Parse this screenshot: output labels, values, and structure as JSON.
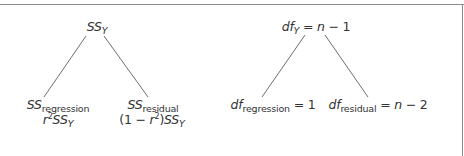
{
  "diagram": {
    "ss_tree": {
      "root": {
        "main": "SS",
        "sub": "Y"
      },
      "left": {
        "main": "SS",
        "sub": "regression",
        "formula": {
          "base": "r",
          "exp": "2",
          "main": "SS",
          "sub": "Y"
        }
      },
      "right": {
        "main": "SS",
        "sub": "residual",
        "formula": {
          "prefix": "(1 − ",
          "base": "r",
          "exp": "2",
          "suffix": ")",
          "main": "SS",
          "sub": "Y"
        }
      }
    },
    "df_tree": {
      "root": {
        "main": "df",
        "sub": "Y",
        "eq": " = ",
        "var": "n",
        "rest": " − 1"
      },
      "left": {
        "main": "df",
        "sub": "regression",
        "eq": " = 1"
      },
      "right": {
        "main": "df",
        "sub": "residual",
        "eq": " = ",
        "var": "n",
        "rest": " − 2"
      }
    },
    "colors": {
      "text": "#333333",
      "line": "#6e6e6e",
      "frame": "#8a8a8a",
      "background": "#ffffff"
    }
  }
}
